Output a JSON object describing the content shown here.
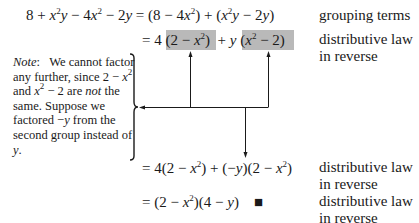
{
  "derivation": {
    "lines": [
      {
        "lhs": "8 + x²y − 4x² − 2y",
        "rhs": "= (8 − 4x²) + (x²y − 2y)",
        "reason": "grouping terms"
      },
      {
        "rhs": "= 4 (2 − x²) + y (x² − 2)",
        "reason": [
          "distributive law",
          "in reverse"
        ]
      },
      {
        "rhs": "= 4(2 − x²) + (−y)(2 − x²)",
        "reason": [
          "distributive law",
          "in reverse"
        ]
      },
      {
        "rhs": "= (2 − x²)(4 − y)",
        "end_mark": "■",
        "reason": [
          "distributive law",
          "in reverse"
        ]
      }
    ]
  },
  "note": {
    "label": "Note",
    "text": [
      "We cannot factor any further, since 2 − x² and x² − 2 are not the same. Suppose we factored −y from the second group instead of y."
    ]
  },
  "colors": {
    "highlight": "#b9b9b9",
    "ink": "#1a1a1a"
  }
}
